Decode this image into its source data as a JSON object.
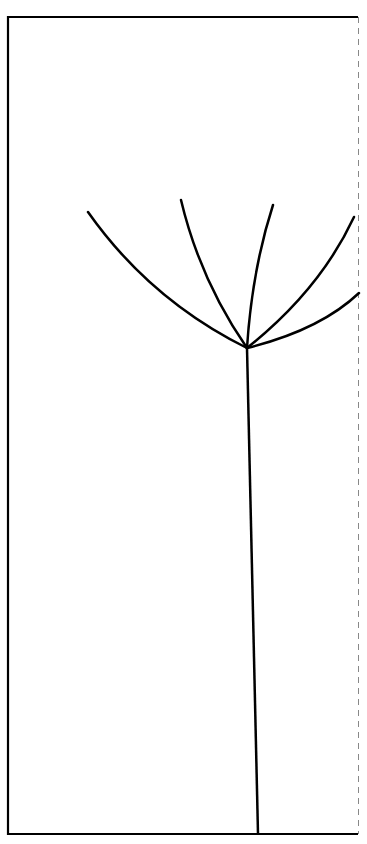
{
  "diagram": {
    "type": "line-drawing",
    "colors": {
      "background": "#ffffff",
      "stroke": "#000000",
      "dashed_edge": "#888888"
    },
    "frame": {
      "left": 8,
      "top": 16,
      "right": 358,
      "bottom": 834,
      "right_edge_style": "dashed"
    },
    "stem": {
      "from": [
        258,
        834
      ],
      "to": [
        247,
        348
      ]
    },
    "hub": [
      247,
      348
    ],
    "branches": [
      {
        "end": [
          88,
          212
        ]
      },
      {
        "end": [
          181,
          200
        ]
      },
      {
        "end": [
          273,
          205
        ]
      },
      {
        "end": [
          354,
          217
        ]
      },
      {
        "end": [
          359,
          293
        ]
      }
    ]
  }
}
